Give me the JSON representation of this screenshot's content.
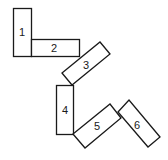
{
  "diagram": {
    "title": "",
    "blocks": [
      {
        "id": 1,
        "label": "1"
      },
      {
        "id": 2,
        "label": "2"
      },
      {
        "id": 3,
        "label": "3"
      },
      {
        "id": 4,
        "label": "4"
      },
      {
        "id": 5,
        "label": "5"
      },
      {
        "id": 6,
        "label": "6"
      }
    ],
    "colors": {
      "stroke": "#1a1a1a",
      "fill": "#ffffff",
      "background": "#ffffff"
    }
  }
}
